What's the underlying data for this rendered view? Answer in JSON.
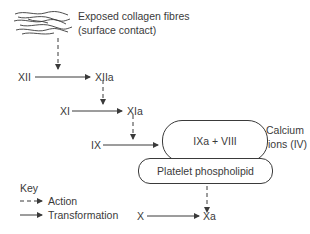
{
  "diagram": {
    "collagen": {
      "line1": "Exposed collagen fibres",
      "line2": "(surface contact)",
      "icon": "collagen-fibres-icon"
    },
    "factors": {
      "xii": "XII",
      "xiia": "XIIa",
      "xi": "XI",
      "xia": "XIa",
      "ix": "IX",
      "complex": "IXa + VIII",
      "phospholipid": "Platelet phospholipid",
      "calcium_line1": "Calcium",
      "calcium_line2": "ions (IV)",
      "x": "X",
      "xa": "Xa"
    },
    "key": {
      "title": "Key",
      "action": "Action",
      "transformation": "Transformation"
    },
    "colors": {
      "line": "#3a3a3a",
      "background": "#ffffff"
    }
  }
}
